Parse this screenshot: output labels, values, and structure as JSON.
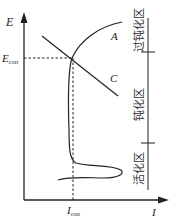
{
  "axes": {
    "y_label": "E",
    "x_label": "I",
    "e_corr_label": "E",
    "e_corr_sub": "corr",
    "i_corr_label": "I",
    "i_corr_sub": "corr"
  },
  "curves": {
    "anodic_label": "A",
    "cathodic_label": "C"
  },
  "regions": [
    {
      "label": "过钝化区"
    },
    {
      "label": "钝化区"
    },
    {
      "label": "活化区"
    }
  ],
  "colors": {
    "line": "#222222",
    "background": "#ffffff"
  }
}
